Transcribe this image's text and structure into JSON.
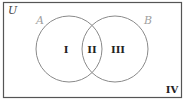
{
  "diagram": {
    "type": "venn",
    "universe_label": "U",
    "sets": [
      {
        "name": "A",
        "color": "#a0a0a0"
      },
      {
        "name": "B",
        "color": "#a0a0a0"
      }
    ],
    "regions": [
      {
        "label": "I",
        "description": "A only"
      },
      {
        "label": "II",
        "description": "A and B"
      },
      {
        "label": "III",
        "description": "B only"
      },
      {
        "label": "IV",
        "description": "neither A nor B"
      }
    ],
    "colors": {
      "border": "#555555",
      "circle": "#8a8a8a",
      "text": "#222222"
    }
  }
}
